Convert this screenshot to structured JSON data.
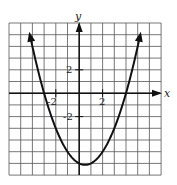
{
  "chart_data": {
    "type": "line",
    "title": "",
    "xlabel": "x",
    "ylabel": "y",
    "xlim": [
      -6,
      7
    ],
    "ylim": [
      -7,
      6
    ],
    "grid": true,
    "grid_step": 1,
    "tick_labels": {
      "x": [
        {
          "value": -2,
          "label": "-2"
        },
        {
          "value": 2,
          "label": "2"
        }
      ],
      "y": [
        {
          "value": 2,
          "label": "2"
        },
        {
          "value": -2,
          "label": "-2"
        }
      ]
    },
    "series": [
      {
        "name": "parabola",
        "equation": "y = 0.5(x + 3)(x - 4)",
        "x": [
          -4.2,
          -4,
          -3,
          -2,
          -1,
          0,
          0.5,
          1,
          2,
          3,
          4,
          5,
          5.2
        ],
        "values": [
          4.92,
          4.0,
          0.0,
          -3.0,
          -5.0,
          -6.0,
          -6.125,
          -6.0,
          -5.0,
          -3.0,
          0.0,
          4.0,
          4.92
        ],
        "arrows_at_ends": true
      }
    ],
    "annotations": {
      "x_intercepts": [
        -3,
        4
      ],
      "vertex": [
        0.5,
        -6.125
      ]
    },
    "legend": null
  },
  "labels": {
    "x_axis": "x",
    "y_axis": "y",
    "tick_x_neg2": "-2",
    "tick_x_pos2": "2",
    "tick_y_pos2": "2",
    "tick_y_neg2": "-2"
  }
}
